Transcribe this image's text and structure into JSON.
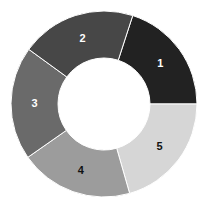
{
  "chart_data": {
    "type": "pie",
    "variant": "donut",
    "title": "",
    "categories": [
      "1",
      "2",
      "3",
      "4",
      "5"
    ],
    "values": [
      20,
      20,
      20,
      20,
      20
    ],
    "order_clockwise_from_top": [
      "2",
      "1",
      "5",
      "4",
      "3"
    ],
    "start_angle_deg": 18,
    "legend": "none",
    "slices": [
      {
        "label": "1",
        "value": 20,
        "color": "#222222",
        "label_color": "#ffffff",
        "start": 18,
        "end": 90
      },
      {
        "label": "5",
        "value": 20,
        "color": "#d6d6d6",
        "label_color": "#111111",
        "start": 90,
        "end": 164
      },
      {
        "label": "4",
        "value": 20,
        "color": "#9c9c9c",
        "label_color": "#111111",
        "start": 164,
        "end": 235
      },
      {
        "label": "3",
        "value": 20,
        "color": "#6a6a6a",
        "label_color": "#ffffff",
        "start": 235,
        "end": 306
      },
      {
        "label": "2",
        "value": 20,
        "color": "#474747",
        "label_color": "#ffffff",
        "start": 306,
        "end": 378
      }
    ],
    "center": [
      104,
      104
    ],
    "outer_radius": 93,
    "inner_radius": 46
  }
}
